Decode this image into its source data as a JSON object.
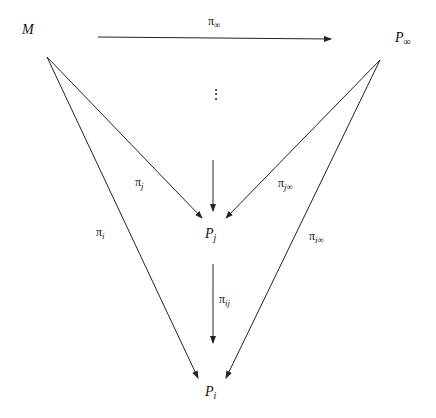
{
  "diagram": {
    "type": "commutative-diagram",
    "nodes": {
      "M": {
        "base": "M",
        "sub": ""
      },
      "P_inf": {
        "base": "P",
        "sub": "∞"
      },
      "P_j": {
        "base": "P",
        "sub": "j"
      },
      "P_i": {
        "base": "P",
        "sub": "i"
      }
    },
    "ellipsis": "⋮",
    "edges": {
      "pi_inf": {
        "base": "π",
        "sub": "∞",
        "from": "M",
        "to": "P_inf"
      },
      "pi_j": {
        "base": "π",
        "sub": "j",
        "from": "M",
        "to": "P_j"
      },
      "pi_i": {
        "base": "π",
        "sub": "i",
        "from": "M",
        "to": "P_i"
      },
      "pi_jinf": {
        "base": "π",
        "sub": "j∞",
        "from": "P_inf",
        "to": "P_j"
      },
      "pi_iinf": {
        "base": "π",
        "sub": "i∞",
        "from": "P_inf",
        "to": "P_i"
      },
      "pi_ij": {
        "base": "π",
        "sub": "ij",
        "from": "P_j",
        "to": "P_i"
      }
    },
    "colors": {
      "stroke": "#222222",
      "background": "#ffffff"
    }
  }
}
